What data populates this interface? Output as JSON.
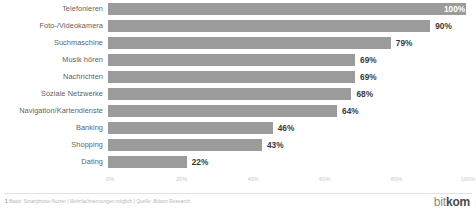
{
  "chart_data": {
    "type": "bar",
    "orientation": "horizontal",
    "title": "",
    "xlabel": "",
    "ylabel": "",
    "xlim": [
      0,
      100
    ],
    "grid": false,
    "categories": [
      "Telefonieren",
      "Foto-/Videokamera",
      "Suchmaschine",
      "Musik hören",
      "Nachrichten",
      "Soziale Netzwerke",
      "Navigation/Kartendienste",
      "Banking",
      "Shopping",
      "Dating"
    ],
    "values": [
      100,
      90,
      79,
      69,
      69,
      68,
      64,
      46,
      43,
      22
    ],
    "value_labels": [
      "100%",
      "90%",
      "79%",
      "69%",
      "69%",
      "68%",
      "64%",
      "46%",
      "43%",
      "22%"
    ],
    "label_placement": [
      "inside",
      "outside",
      "outside",
      "outside",
      "outside",
      "outside",
      "outside",
      "outside",
      "outside",
      "outside"
    ],
    "xticks": [
      0,
      20,
      40,
      60,
      80,
      100
    ],
    "xtick_labels": [
      "0%",
      "20%",
      "40%",
      "60%",
      "80%",
      "100%"
    ],
    "bar_color": "#9b9b9b",
    "value_label_color": "#3a3a3a",
    "value_label_color_inside": "#ffffff",
    "category_label_color": "#5f5f5f",
    "tick_label_color": "#c9c9c9",
    "background": "#ffffff"
  },
  "footer": {
    "note_number": "1",
    "note_text": "Basis: Smartphone-Nutzer | Mehrfachnennungen möglich | Quelle: Bitkom Research",
    "logo_light": "bit",
    "logo_bold": "kom"
  }
}
